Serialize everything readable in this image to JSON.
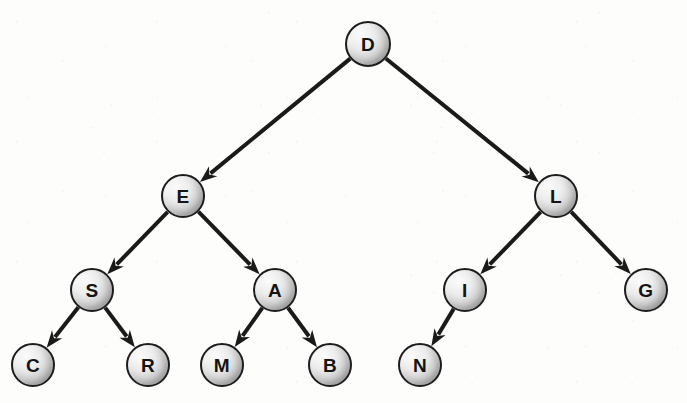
{
  "diagram": {
    "background_color": "#fdfdfb",
    "node_fill_light": "#fbfbfb",
    "node_fill_dark": "#9a9a9a",
    "node_stroke_color": "#1c1c1c",
    "edge_color": "#1a1a1a",
    "node_radius": 22,
    "root_radius": 23,
    "edge_width": 4
  },
  "nodes": [
    {
      "id": "D",
      "label": "D",
      "cx": 368,
      "cy": 44,
      "r": 23,
      "level": 0
    },
    {
      "id": "E",
      "label": "E",
      "cx": 183,
      "cy": 196,
      "r": 22,
      "level": 1
    },
    {
      "id": "L",
      "label": "L",
      "cx": 556,
      "cy": 196,
      "r": 22,
      "level": 1
    },
    {
      "id": "S",
      "label": "S",
      "cx": 92,
      "cy": 290,
      "r": 22,
      "level": 2
    },
    {
      "id": "A",
      "label": "A",
      "cx": 275,
      "cy": 290,
      "r": 22,
      "level": 2
    },
    {
      "id": "I",
      "label": "I",
      "cx": 465,
      "cy": 290,
      "r": 22,
      "level": 2
    },
    {
      "id": "G",
      "label": "G",
      "cx": 646,
      "cy": 290,
      "r": 22,
      "level": 2
    },
    {
      "id": "C",
      "label": "C",
      "cx": 33,
      "cy": 365,
      "r": 22,
      "level": 3
    },
    {
      "id": "R",
      "label": "R",
      "cx": 148,
      "cy": 365,
      "r": 22,
      "level": 3
    },
    {
      "id": "M",
      "label": "M",
      "cx": 222,
      "cy": 365,
      "r": 22,
      "level": 3
    },
    {
      "id": "B",
      "label": "B",
      "cx": 330,
      "cy": 365,
      "r": 22,
      "level": 3
    },
    {
      "id": "N",
      "label": "N",
      "cx": 420,
      "cy": 365,
      "r": 22,
      "level": 3
    }
  ],
  "edges": [
    {
      "from": "D",
      "to": "E",
      "direction": "down-left",
      "arrow": true
    },
    {
      "from": "D",
      "to": "L",
      "direction": "down-right",
      "arrow": true
    },
    {
      "from": "E",
      "to": "S",
      "direction": "down-left",
      "arrow": true
    },
    {
      "from": "E",
      "to": "A",
      "direction": "down-right",
      "arrow": true
    },
    {
      "from": "L",
      "to": "I",
      "direction": "down-left",
      "arrow": true
    },
    {
      "from": "L",
      "to": "G",
      "direction": "down-right",
      "arrow": true
    },
    {
      "from": "S",
      "to": "C",
      "direction": "down-left",
      "arrow": true
    },
    {
      "from": "S",
      "to": "R",
      "direction": "down-right",
      "arrow": true
    },
    {
      "from": "A",
      "to": "M",
      "direction": "down-left",
      "arrow": true
    },
    {
      "from": "A",
      "to": "B",
      "direction": "down-right",
      "arrow": true
    },
    {
      "from": "I",
      "to": "N",
      "direction": "down-left",
      "arrow": true
    }
  ],
  "tree": {
    "root": "D",
    "children": {
      "D": [
        "E",
        "L"
      ],
      "E": [
        "S",
        "A"
      ],
      "L": [
        "I",
        "G"
      ],
      "S": [
        "C",
        "R"
      ],
      "A": [
        "M",
        "B"
      ],
      "I": [
        "N"
      ],
      "G": [],
      "C": [],
      "R": [],
      "M": [],
      "B": [],
      "N": []
    },
    "leaves": [
      "C",
      "R",
      "M",
      "B",
      "N",
      "G"
    ],
    "depth": 4,
    "node_count": 12
  }
}
